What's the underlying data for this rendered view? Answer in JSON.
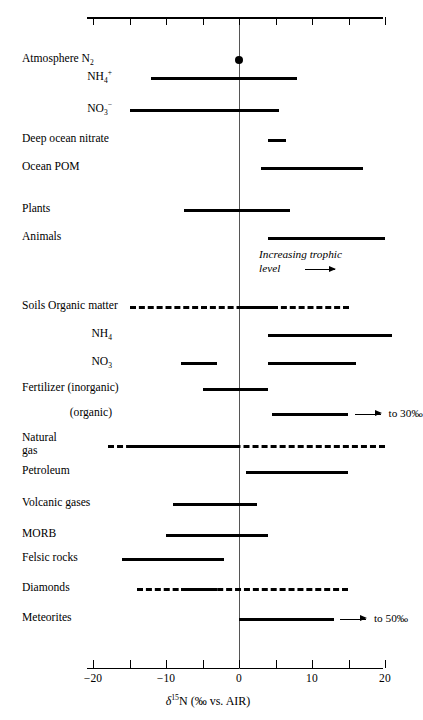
{
  "chart_data": {
    "type": "bar",
    "title": "",
    "xlabel": "δ15N (‰ vs. AIR)",
    "xlabel_parts": {
      "delta": "δ",
      "mass": "15",
      "element": "N",
      "units": " (‰ vs. AIR)"
    },
    "xlim": [
      -20,
      20
    ],
    "xticks": [
      -20,
      -15,
      -10,
      -5,
      0,
      5,
      10,
      15,
      20
    ],
    "xtick_labels": [
      "−20",
      "",
      "−10",
      "",
      "0",
      "",
      "10",
      "",
      "20"
    ],
    "grid": false,
    "legend": false,
    "orientation": "horizontal-range",
    "zero_reference_line": 0,
    "categories": [
      {
        "label": "Atmosphere N2",
        "label_html": "Atmosphere N<sub>2</sub>",
        "align": "left",
        "marker": "dot",
        "value": 0,
        "segments": []
      },
      {
        "label": "NH4+",
        "label_html": "NH<sub>4</sub><sup>+</sup>",
        "align": "right",
        "segments": [
          {
            "start": -12.0,
            "end": 8.0,
            "style": "solid"
          }
        ]
      },
      {
        "label": "NO3-",
        "label_html": "NO<sub>3</sub><sup>−</sup>",
        "align": "right",
        "segments": [
          {
            "start": -15.0,
            "end": 5.5,
            "style": "solid"
          }
        ]
      },
      {
        "label": "Deep ocean nitrate",
        "label_html": "Deep ocean nitrate",
        "align": "left",
        "segments": [
          {
            "start": 4.0,
            "end": 6.5,
            "style": "solid"
          }
        ]
      },
      {
        "label": "Ocean POM",
        "label_html": "Ocean POM",
        "align": "left",
        "segments": [
          {
            "start": 3.0,
            "end": 17.0,
            "style": "solid"
          }
        ]
      },
      {
        "label": "Plants",
        "label_html": "Plants",
        "align": "left",
        "segments": [
          {
            "start": -7.5,
            "end": 7.0,
            "style": "solid"
          }
        ]
      },
      {
        "label": "Animals",
        "label_html": "Animals",
        "align": "left",
        "segments": [
          {
            "start": 4.0,
            "end": 20.0,
            "style": "solid"
          }
        ]
      },
      {
        "label": "Soils Organic matter",
        "label_html": "Soils Organic matter",
        "align": "left",
        "segments": [
          {
            "start": -15.0,
            "end": 15.0,
            "style": "dashed"
          },
          {
            "start": 0.0,
            "end": 5.0,
            "style": "solid"
          }
        ]
      },
      {
        "label": "NH4",
        "label_html": "NH<sub>4</sub>",
        "align": "right",
        "segments": [
          {
            "start": 4.0,
            "end": 21.0,
            "style": "solid"
          }
        ]
      },
      {
        "label": "NO3",
        "label_html": "NO<sub>3</sub>",
        "align": "right",
        "segments": [
          {
            "start": -8.0,
            "end": -3.0,
            "style": "solid"
          },
          {
            "start": 4.0,
            "end": 16.0,
            "style": "solid"
          }
        ]
      },
      {
        "label": "Fertilizer (inorganic)",
        "label_html": "Fertilizer (inorganic)",
        "align": "left",
        "segments": [
          {
            "start": -5.0,
            "end": 4.0,
            "style": "solid"
          }
        ]
      },
      {
        "label": "(organic)",
        "label_html": "(organic)",
        "align": "right",
        "segments": [
          {
            "start": 4.5,
            "end": 15.0,
            "style": "solid"
          }
        ],
        "note": "to 30‰",
        "note_arrow": true
      },
      {
        "label": "Natural gas",
        "label_html": "Natural<br>gas",
        "align": "left",
        "segments": [
          {
            "start": -18.0,
            "end": 20.0,
            "style": "dashed"
          },
          {
            "start": -15.0,
            "end": 0.0,
            "style": "solid"
          }
        ]
      },
      {
        "label": "Petroleum",
        "label_html": "Petroleum",
        "align": "left",
        "segments": [
          {
            "start": 1.0,
            "end": 15.0,
            "style": "solid"
          }
        ]
      },
      {
        "label": "Volcanic gases",
        "label_html": "Volcanic gases",
        "align": "left",
        "segments": [
          {
            "start": -9.0,
            "end": 2.5,
            "style": "solid"
          }
        ]
      },
      {
        "label": "MORB",
        "label_html": "MORB",
        "align": "left",
        "segments": [
          {
            "start": -10.0,
            "end": 4.0,
            "style": "solid"
          }
        ]
      },
      {
        "label": "Felsic rocks",
        "label_html": "Felsic rocks",
        "align": "left",
        "segments": [
          {
            "start": -16.0,
            "end": -2.0,
            "style": "solid"
          }
        ]
      },
      {
        "label": "Diamonds",
        "label_html": "Diamonds",
        "align": "left",
        "segments": [
          {
            "start": -14.0,
            "end": 15.0,
            "style": "dashed"
          },
          {
            "start": -8.0,
            "end": -3.0,
            "style": "solid"
          }
        ]
      },
      {
        "label": "Meteorites",
        "label_html": "Meteorites",
        "align": "left",
        "segments": [
          {
            "start": 0.0,
            "end": 13.0,
            "style": "solid"
          }
        ],
        "note": "to 50‰",
        "note_arrow": true
      }
    ],
    "annotations": [
      {
        "text": "Increasing trophic level",
        "text_line1": "Increasing trophic",
        "text_line2": "level",
        "style": "italic",
        "arrow": true
      }
    ]
  },
  "layout": {
    "rows_y": [
      60,
      78,
      110,
      140,
      168,
      210,
      238,
      307,
      335,
      363,
      389,
      414,
      446,
      472,
      504,
      535,
      559,
      589,
      619
    ],
    "label_x_left": 22,
    "label_x_right": 112,
    "plot_left": 87,
    "plot_right": 383,
    "x_zero_px": 239,
    "px_per_unit": 7.3
  }
}
